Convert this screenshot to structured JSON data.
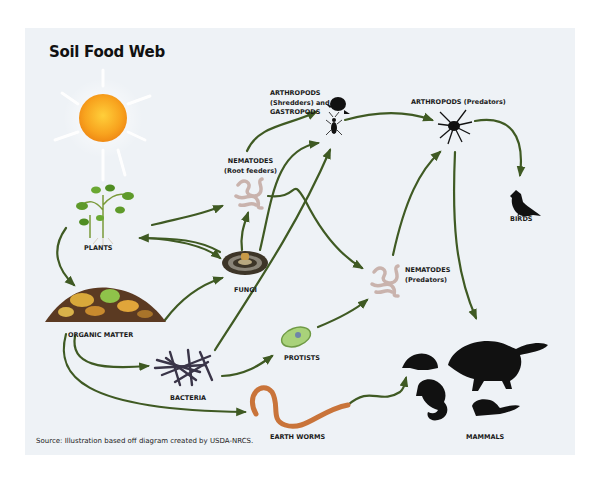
{
  "diagram": {
    "title": "Soil Food Web",
    "source": "Source: Illustration based off diagram created by USDA-NRCS.",
    "colors": {
      "background": "#eef2f6",
      "arrow": "#3f5a23",
      "sun": "#f7a21b",
      "nematode": "#c9b3ad",
      "earthworm": "#c9743a",
      "silhouette": "#111111"
    },
    "nodes": [
      {
        "id": "sun",
        "label": "",
        "icon": "sun-icon"
      },
      {
        "id": "plants",
        "label": "PLANTS",
        "icon": "plant-icon"
      },
      {
        "id": "organic_matter",
        "label": "ORGANIC MATTER",
        "icon": "compost-icon"
      },
      {
        "id": "nematodes_root",
        "label_line1": "NEMATODES",
        "label_line2": "(Root feeders)",
        "icon": "nematode-icon"
      },
      {
        "id": "fungi",
        "label": "FUNGI",
        "icon": "mushroom-icon"
      },
      {
        "id": "bacteria",
        "label": "BACTERIA",
        "icon": "bacteria-icon"
      },
      {
        "id": "protists",
        "label": "PROTISTS",
        "icon": "protist-icon"
      },
      {
        "id": "earthworms",
        "label": "EARTH WORMS",
        "icon": "earthworm-icon"
      },
      {
        "id": "arthropods_shredders",
        "label_line1": "ARTHROPODS",
        "label_line2": "(Shredders) and",
        "label_line3": "GASTROPODS",
        "icon": "beetle-snail-icon"
      },
      {
        "id": "arthropods_predators",
        "label": "ARTHROPODS (Predators)",
        "icon": "spider-icon"
      },
      {
        "id": "nematodes_pred",
        "label_line1": "NEMATODES",
        "label_line2": "(Predators)",
        "icon": "nematode-icon"
      },
      {
        "id": "birds",
        "label": "BIRDS",
        "icon": "bird-icon"
      },
      {
        "id": "mammals",
        "label": "MAMMALS",
        "icon": "mammals-icon"
      }
    ],
    "edges": [
      {
        "from": "plants",
        "to": "organic_matter"
      },
      {
        "from": "plants",
        "to": "nematodes_root"
      },
      {
        "from": "plants",
        "to": "fungi"
      },
      {
        "from": "fungi",
        "to": "plants"
      },
      {
        "from": "organic_matter",
        "to": "fungi"
      },
      {
        "from": "organic_matter",
        "to": "bacteria"
      },
      {
        "from": "organic_matter",
        "to": "earthworms"
      },
      {
        "from": "fungi",
        "to": "nematodes_root"
      },
      {
        "from": "fungi",
        "to": "arthropods_shredders"
      },
      {
        "from": "nematodes_root",
        "to": "arthropods_shredders"
      },
      {
        "from": "nematodes_root",
        "to": "nematodes_pred"
      },
      {
        "from": "bacteria",
        "to": "arthropods_shredders"
      },
      {
        "from": "bacteria",
        "to": "protists"
      },
      {
        "from": "protists",
        "to": "nematodes_pred"
      },
      {
        "from": "arthropods_shredders",
        "to": "arthropods_predators"
      },
      {
        "from": "nematodes_pred",
        "to": "arthropods_predators"
      },
      {
        "from": "arthropods_predators",
        "to": "birds"
      },
      {
        "from": "arthropods_predators",
        "to": "mammals"
      },
      {
        "from": "earthworms",
        "to": "mammals"
      }
    ]
  }
}
